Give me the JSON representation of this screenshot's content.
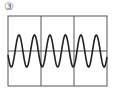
{
  "label": "③",
  "figure": {
    "type": "oscilloscope-waveform",
    "grid_columns": 3,
    "waveform": "sine",
    "cycles_visible": 6.4,
    "colors": {
      "frame": "#555555",
      "wave": "#222222",
      "background": "#ffffff"
    }
  }
}
